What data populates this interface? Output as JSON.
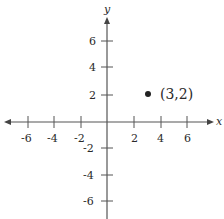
{
  "diagram": {
    "type": "coordinate-plane",
    "axes": {
      "x_label": "x",
      "y_label": "y",
      "x_ticks": [
        "-6",
        "-4",
        "-2",
        "2",
        "4",
        "6"
      ],
      "y_ticks": [
        "6",
        "4",
        "2",
        "-2",
        "-4",
        "-6"
      ]
    },
    "point": {
      "x": 3,
      "y": 2,
      "label": "(3,2)"
    },
    "colors": {
      "line": "#555555",
      "text": "#2a2a2a",
      "point": "#222222"
    }
  }
}
